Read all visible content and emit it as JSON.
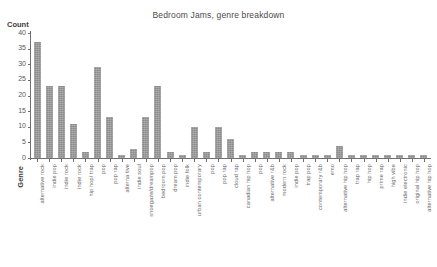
{
  "chart_data": {
    "type": "bar",
    "title": "Bedroom Jams, genre breakdown",
    "xlabel": "Genre",
    "ylabel": "Count",
    "ylim": [
      0,
      40
    ],
    "yticks": [
      0,
      5,
      10,
      15,
      20,
      25,
      30,
      35,
      40
    ],
    "grid": false,
    "legend": null,
    "bar_color": "#8a8a8a",
    "categories": [
      "alternative rock",
      "indie pop",
      "indie rock",
      "indie rock",
      "hip hop/ trap",
      "pop",
      "pop rap",
      "alterna tive",
      "indie soul",
      "shoegaze/dreampop",
      "bedroom pop",
      "dream pop",
      "indie folk",
      "urban contemporary",
      "pop",
      "pop rap",
      "cloud rap",
      "canadian hip hop",
      "pop",
      "alternative r&b",
      "modern rock",
      "indie pop",
      "trap pop",
      "contemporary r&b",
      "emo",
      "alternative hip hop",
      "trap rap",
      "hip hop",
      "prime rap",
      "high vibe",
      "indie electronic",
      "original hip hop",
      "alternative hip hop"
    ],
    "values": [
      37,
      23,
      23,
      11,
      2,
      29,
      13,
      1,
      3,
      13,
      23,
      2,
      1,
      10,
      2,
      10,
      6,
      1,
      2,
      2,
      2,
      2,
      1,
      1,
      1,
      4,
      1,
      1,
      1,
      1,
      1,
      1,
      1
    ]
  }
}
